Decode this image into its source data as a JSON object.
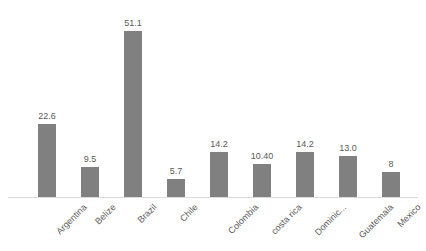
{
  "chart_data": {
    "type": "bar",
    "title": "",
    "subtitle": "",
    "xlabel": "",
    "ylabel": "",
    "categories": [
      "Argentina",
      "Belize",
      "Brazil",
      "Chile",
      "Colombia",
      "costa rica",
      "Dominic...",
      "Guatemala",
      "Mexico"
    ],
    "values": [
      22.6,
      9.5,
      51.1,
      5.7,
      14.2,
      10.4,
      14.2,
      13.0,
      8
    ],
    "value_labels": [
      "22.6",
      "9.5",
      "51.1",
      "5.7",
      "14.2",
      "10.40",
      "14.2",
      "13.0",
      "8"
    ],
    "ylim": [
      0,
      51.1
    ],
    "grid": false,
    "legend": false,
    "y_axis_visible": false,
    "baseline_visible": true,
    "tick_label_rotation": -45,
    "colors": {
      "bar": "#808080",
      "text": "#5a5a5a",
      "baseline": "#d9d9d9",
      "background": "#ffffff"
    }
  }
}
